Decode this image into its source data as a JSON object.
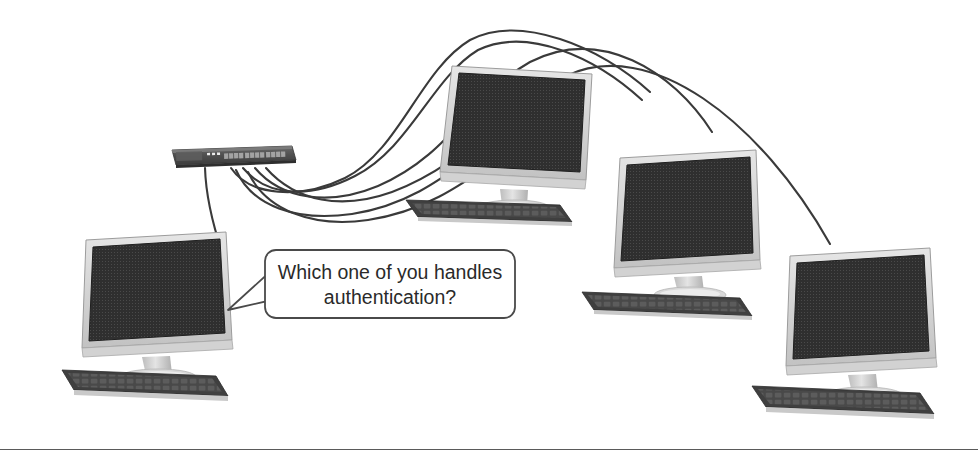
{
  "figure": {
    "kind": "network-illustration",
    "background_color": "#ffffff",
    "line_color": "#3a3a3a",
    "bottom_rule_color": "#5a5a5a"
  },
  "speech_bubble": {
    "name": "speech-bubble",
    "line1": "Which one of you handles",
    "line2": "authentication?",
    "border_color": "#4a4a4a",
    "fill_color": "#ffffff",
    "text_color": "#2a2a2a",
    "tail_points_to": "workstation-left"
  },
  "switch": {
    "name": "network-switch",
    "body_color": "#4f4f4f",
    "port_color": "#9a9a9a",
    "led_color": "#e8e8e8",
    "port_count": 24,
    "led_count": 3
  },
  "workstations": [
    {
      "id": "workstation-top",
      "label": "workstation-top",
      "screen_color": "#2f2f2f",
      "bezel_color": "#d8d8d8",
      "stand_color": "#cfcfcf",
      "keyboard_color": "#4a4a4a"
    },
    {
      "id": "workstation-middle-right",
      "label": "workstation-middle-right",
      "screen_color": "#2f2f2f",
      "bezel_color": "#d8d8d8",
      "stand_color": "#cfcfcf",
      "keyboard_color": "#4a4a4a"
    },
    {
      "id": "workstation-bottom-right",
      "label": "workstation-bottom-right",
      "screen_color": "#2f2f2f",
      "bezel_color": "#d8d8d8",
      "stand_color": "#cfcfcf",
      "keyboard_color": "#4a4a4a"
    },
    {
      "id": "workstation-left",
      "label": "workstation-left",
      "screen_color": "#2f2f2f",
      "bezel_color": "#d8d8d8",
      "stand_color": "#cfcfcf",
      "keyboard_color": "#4a4a4a"
    }
  ],
  "cables": {
    "name": "network-cables",
    "count": 4,
    "color": "#3a3a3a",
    "connections": [
      "switch -> workstation-left",
      "switch -> workstation-top",
      "switch -> workstation-middle-right",
      "switch -> workstation-bottom-right"
    ]
  }
}
